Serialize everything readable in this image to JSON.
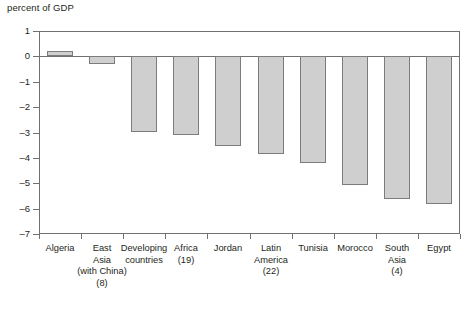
{
  "chart_data": {
    "type": "bar",
    "title": "",
    "subtitle": "",
    "xlabel": "",
    "ylabel": "percent of GDP",
    "ylim": [
      -7,
      1
    ],
    "yticks": [
      1,
      0,
      -1,
      -2,
      -3,
      -4,
      -5,
      -6,
      -7
    ],
    "ytick_labels": [
      "1",
      "0",
      "–1",
      "–2",
      "–3",
      "–4",
      "–5",
      "–6",
      "–7"
    ],
    "grid": false,
    "legend": "none",
    "zero_line": 0,
    "categories": [
      "Algeria",
      "East Asia (with China) (8)",
      "Developing countries",
      "Africa (19)",
      "Jordan",
      "Latin America (22)",
      "Tunisia",
      "Morocco",
      "South Asia (4)",
      "Egypt"
    ],
    "category_label_lines": [
      [
        "Algeria"
      ],
      [
        "East",
        "Asia",
        "(with China)",
        "(8)"
      ],
      [
        "Developing",
        "countries"
      ],
      [
        "Africa",
        "(19)"
      ],
      [
        "Jordan"
      ],
      [
        "Latin",
        "America",
        "(22)"
      ],
      [
        "Tunisia"
      ],
      [
        "Morocco"
      ],
      [
        "South",
        "Asia",
        "(4)"
      ],
      [
        "Egypt"
      ]
    ],
    "values": [
      0.2,
      -0.3,
      -3.0,
      -3.1,
      -3.55,
      -3.85,
      -4.2,
      -5.1,
      -5.65,
      -5.85
    ],
    "bar_color": "#cfcfcf",
    "bar_edge_color": "#7b7c7e",
    "axis_color": "#6f7072",
    "text_color": "#231f20"
  }
}
